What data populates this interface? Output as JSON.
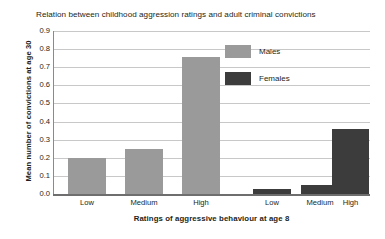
{
  "chart_data": {
    "type": "bar",
    "title": "Relation between childhood aggression ratings and adult criminal convictions",
    "xlabel": "Ratings of aggressive behaviour at age 8",
    "ylabel": "Mean number of convictions at age 30",
    "categories": [
      "Low",
      "Medium",
      "High"
    ],
    "groups": [
      "Males",
      "Females"
    ],
    "series": [
      {
        "name": "Males",
        "values": [
          0.2,
          0.25,
          0.755
        ],
        "color": "#9a9a9a"
      },
      {
        "name": "Females",
        "values": [
          0.03,
          0.05,
          0.36
        ],
        "color": "#3c3c3c"
      }
    ],
    "bars": [
      {
        "group": "Males",
        "category": "Low",
        "value": 0.2,
        "label": "Low"
      },
      {
        "group": "Males",
        "category": "Medium",
        "value": 0.25,
        "label": "Medium"
      },
      {
        "group": "Males",
        "category": "High",
        "value": 0.755,
        "label": "High"
      },
      {
        "group": "Females",
        "category": "Low",
        "value": 0.03,
        "label": "Low"
      },
      {
        "group": "Females",
        "category": "Medium",
        "value": 0.05,
        "label": "Medium"
      },
      {
        "group": "Females",
        "category": "High",
        "value": 0.36,
        "label": "High"
      }
    ],
    "ylim": [
      0.0,
      0.9
    ],
    "ytick_labels": [
      "0.9",
      "0.8",
      "0.7",
      "0.6",
      "0.5",
      "0.4",
      "0.3",
      "0.2",
      "0.1",
      "0.0"
    ],
    "ytick_values": [
      0.9,
      0.8,
      0.7,
      0.6,
      0.5,
      0.4,
      0.3,
      0.2,
      0.1,
      0.0
    ],
    "xtick_labels": [
      "Low",
      "Medium",
      "High",
      "Low",
      "Medium",
      "High"
    ],
    "grid": true,
    "grid_color": "#c8c8c8",
    "legend_position": "upper right",
    "legend": [
      {
        "label": "Males",
        "color": "#9a9a9a"
      },
      {
        "label": "Females",
        "color": "#3c3c3c"
      }
    ],
    "background": "#ffffff"
  }
}
